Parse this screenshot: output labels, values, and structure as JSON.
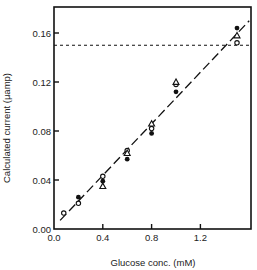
{
  "chart_data": {
    "type": "scatter",
    "title": "",
    "xlabel": "Glucose conc. (mM)",
    "ylabel": "Calculated current (μamp)",
    "xlim": [
      0.0,
      1.6
    ],
    "ylim": [
      0.0,
      0.176
    ],
    "x_ticks": [
      "0.0",
      "0.4",
      "0.8",
      "1.2"
    ],
    "y_ticks": [
      "0.00",
      "0.04",
      "0.08",
      "0.12",
      "0.16"
    ],
    "grid": false,
    "legend": "none",
    "series": [
      {
        "name": "open circles",
        "marker": "open-circle",
        "points": [
          [
            0.08,
            0.013
          ],
          [
            0.2,
            0.021
          ],
          [
            0.4,
            0.043
          ],
          [
            0.6,
            0.064
          ],
          [
            0.8,
            0.082
          ],
          [
            1.0,
            0.118
          ],
          [
            1.5,
            0.152
          ]
        ]
      },
      {
        "name": "filled circles",
        "marker": "filled-circle",
        "points": [
          [
            0.2,
            0.026
          ],
          [
            0.4,
            0.039
          ],
          [
            0.6,
            0.057
          ],
          [
            0.8,
            0.078
          ],
          [
            1.0,
            0.112
          ],
          [
            1.5,
            0.164
          ]
        ]
      },
      {
        "name": "open triangles",
        "marker": "open-triangle",
        "points": [
          [
            0.4,
            0.035
          ],
          [
            0.6,
            0.062
          ],
          [
            0.8,
            0.086
          ],
          [
            1.0,
            0.12
          ],
          [
            1.5,
            0.158
          ]
        ]
      }
    ],
    "fit_line": {
      "style": "dashed",
      "from": [
        0.05,
        0.007
      ],
      "to": [
        1.6,
        0.17
      ]
    },
    "reference_line": {
      "style": "dotted",
      "y": 0.15
    }
  }
}
